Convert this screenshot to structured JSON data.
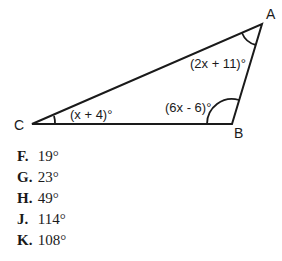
{
  "diagram": {
    "vertices": {
      "A": {
        "label": "A"
      },
      "B": {
        "label": "B"
      },
      "C": {
        "label": "C"
      }
    },
    "angles": {
      "A": "(2x + 11)°",
      "B": "(6x - 6)°",
      "C": "(x + 4)°"
    }
  },
  "choices": [
    {
      "letter": "F.",
      "value": "19°"
    },
    {
      "letter": "G.",
      "value": "23°"
    },
    {
      "letter": "H.",
      "value": "49°"
    },
    {
      "letter": "J.",
      "value": "114°"
    },
    {
      "letter": "K.",
      "value": "108°"
    }
  ]
}
